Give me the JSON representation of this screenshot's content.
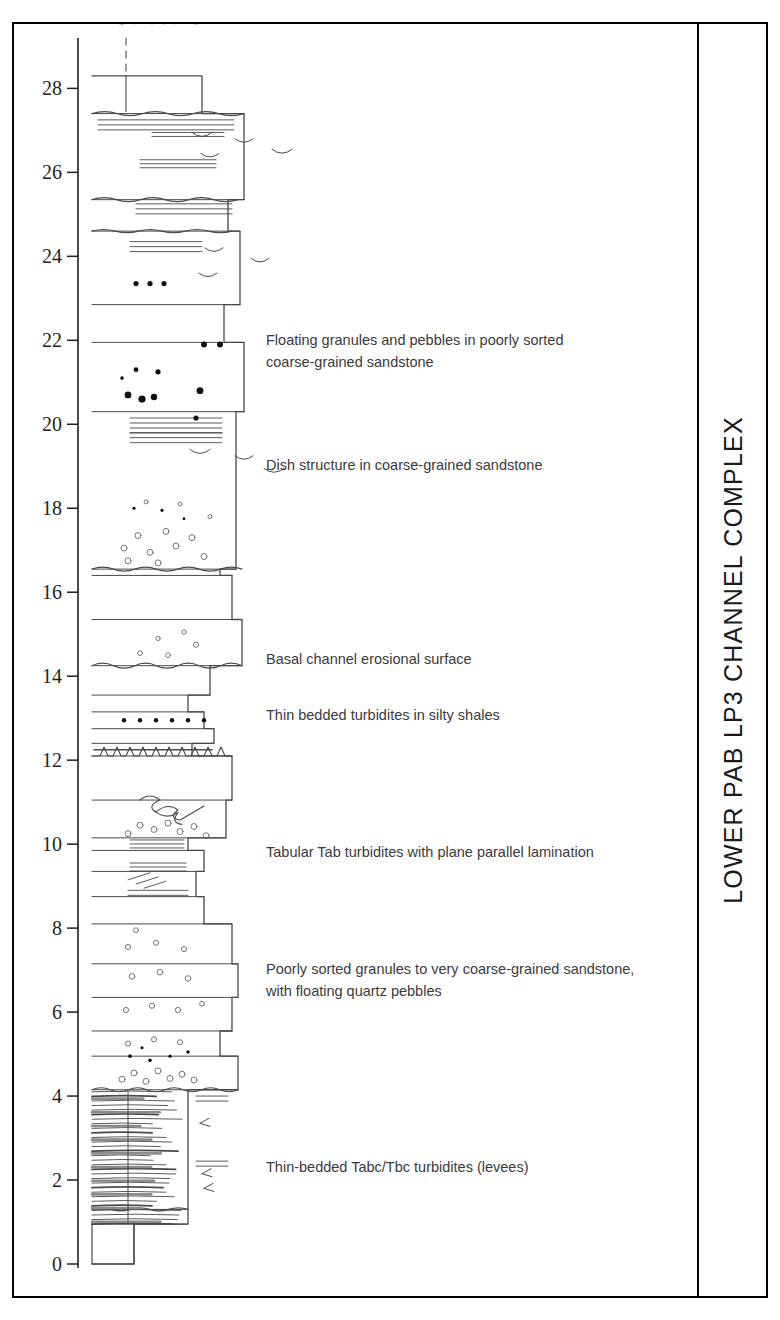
{
  "figure": {
    "title_vertical": "LOWER PAB  LP3 CHANNEL COMPLEX",
    "axis": {
      "unit_hint": "metres",
      "min": 0,
      "max": 29.2,
      "tick_step": 2,
      "ticks": [
        "0",
        "2",
        "4",
        "6",
        "8",
        "10",
        "12",
        "14",
        "16",
        "18",
        "20",
        "22",
        "24",
        "26",
        "28"
      ]
    },
    "annotations": [
      {
        "id": "ann-floating-granules",
        "level": 21.9,
        "lines": [
          "Floating granules and pebbles in  poorly sorted",
          "coarse-grained sandstone"
        ]
      },
      {
        "id": "ann-dish-structure",
        "level": 18.9,
        "lines": [
          "Dish structure in coarse-grained sandstone"
        ]
      },
      {
        "id": "ann-basal-channel",
        "level": 14.3,
        "lines": [
          "Basal channel erosional surface"
        ]
      },
      {
        "id": "ann-thin-bedded-silty",
        "level": 12.95,
        "lines": [
          "Thin bedded turbidites in silty shales"
        ]
      },
      {
        "id": "ann-tabular-tab",
        "level": 9.7,
        "lines": [
          "Tabular Tab turbidites with plane parallel lamination"
        ]
      },
      {
        "id": "ann-poorly-sorted",
        "level": 6.9,
        "lines": [
          "Poorly sorted granules to very coarse-grained sandstone,",
          "with floating quartz pebbles"
        ]
      },
      {
        "id": "ann-thin-bedded-levees",
        "level": 2.2,
        "lines": [
          "Thin-bedded Tabc/Tbc turbidites (levees)"
        ]
      }
    ],
    "colors": {
      "ink": "#231f20",
      "line": "#4a4a4a",
      "frame": "#000000",
      "annotation_text": "#3a3a3a",
      "pebble_fill": "#111111",
      "granule_stroke": "#777777"
    },
    "units_legend": [
      {
        "from": 0.0,
        "to": 4.15,
        "facies": "thin-bedded Tabc/Tbc turbidites (levees)",
        "width_class": "narrow"
      },
      {
        "from": 4.15,
        "to": 8.1,
        "facies": "poorly sorted granules, very coarse sandstone with floating quartz pebbles",
        "width_class": "wide"
      },
      {
        "from": 8.1,
        "to": 12.1,
        "facies": "tabular Tab turbidites, plane parallel lamination",
        "width_class": "medium"
      },
      {
        "from": 12.1,
        "to": 14.25,
        "facies": "thin bedded turbidites in silty shales",
        "width_class": "narrow"
      },
      {
        "from": 14.25,
        "to": 16.4,
        "facies": "channel sandstone above basal erosional surface",
        "width_class": "wide"
      },
      {
        "from": 16.4,
        "to": 20.3,
        "facies": "dish-structured coarse-grained sandstone",
        "width_class": "wide"
      },
      {
        "from": 20.3,
        "to": 22.2,
        "facies": "floating granules and pebbles, poorly sorted coarse sandstone",
        "width_class": "wide"
      },
      {
        "from": 22.2,
        "to": 27.4,
        "facies": "laminated sandstone with wavy laminae",
        "width_class": "wide"
      },
      {
        "from": 27.4,
        "to": 28.3,
        "facies": "thin bed / capping siltstone",
        "width_class": "narrow"
      }
    ]
  }
}
